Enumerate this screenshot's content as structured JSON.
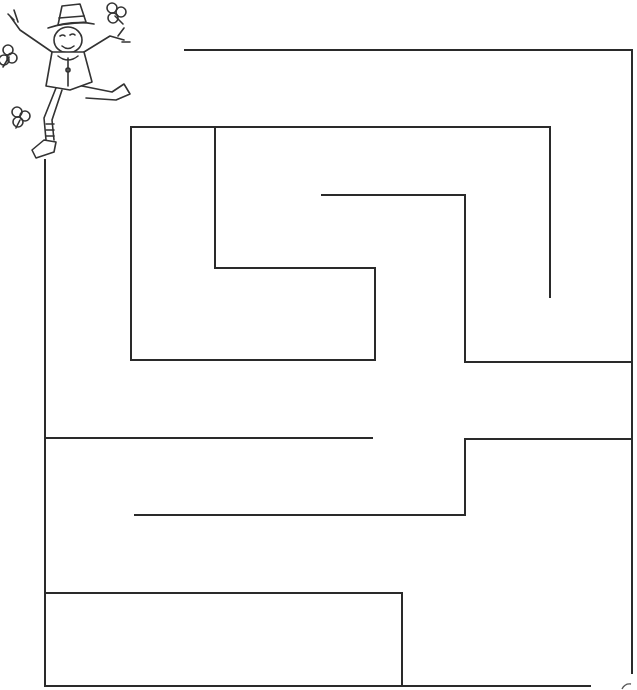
{
  "puzzle": {
    "type": "maze",
    "theme": "leprechaun",
    "stroke_color": "#2a2a2a",
    "background": "#ffffff",
    "start_character": "leprechaun-icon",
    "walls": [
      [
        185,
        50,
        632,
        50
      ],
      [
        632,
        50,
        632,
        673
      ],
      [
        45,
        160,
        45,
        686
      ],
      [
        45,
        686,
        590,
        686
      ],
      [
        131,
        127,
        550,
        127
      ],
      [
        131,
        127,
        131,
        360
      ],
      [
        131,
        360,
        375,
        360
      ],
      [
        215,
        127,
        215,
        268
      ],
      [
        215,
        268,
        375,
        268
      ],
      [
        375,
        268,
        375,
        360
      ],
      [
        550,
        127,
        550,
        297
      ],
      [
        322,
        195,
        465,
        195
      ],
      [
        465,
        195,
        465,
        362
      ],
      [
        465,
        362,
        632,
        362
      ],
      [
        45,
        438,
        372,
        438
      ],
      [
        465,
        439,
        632,
        439
      ],
      [
        465,
        439,
        465,
        515
      ],
      [
        135,
        515,
        465,
        515
      ],
      [
        45,
        593,
        402,
        593
      ],
      [
        402,
        593,
        402,
        686
      ]
    ]
  }
}
